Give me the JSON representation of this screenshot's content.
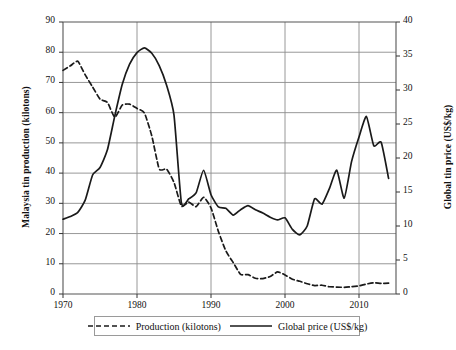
{
  "chart_data": {
    "type": "line",
    "title": "",
    "xlabel": "",
    "xlim": [
      1970,
      2015
    ],
    "xticks": [
      1970,
      1980,
      1990,
      2000,
      2010
    ],
    "grid": true,
    "legend_position": "bottom",
    "axes": [
      {
        "id": "left",
        "label": "Malaysia tin production (kilotons)",
        "ylim": [
          0,
          90
        ],
        "yticks": [
          0,
          10,
          20,
          30,
          40,
          50,
          60,
          70,
          80,
          90
        ]
      },
      {
        "id": "right",
        "label": "Global tin price (US$/kg)",
        "ylim": [
          0,
          40
        ],
        "yticks": [
          0,
          5,
          10,
          15,
          20,
          25,
          30,
          35,
          40
        ]
      }
    ],
    "x": [
      1970,
      1971,
      1972,
      1973,
      1974,
      1975,
      1976,
      1977,
      1978,
      1979,
      1980,
      1981,
      1982,
      1983,
      1984,
      1985,
      1986,
      1987,
      1988,
      1989,
      1990,
      1991,
      1992,
      1993,
      1994,
      1995,
      1996,
      1997,
      1998,
      1999,
      2000,
      2001,
      2002,
      2003,
      2004,
      2005,
      2006,
      2007,
      2008,
      2009,
      2010,
      2011,
      2012,
      2013,
      2014
    ],
    "series": [
      {
        "name": "Production (kilotons)",
        "axis": "left",
        "style": "dashed",
        "color": "#1a1a1a",
        "values": [
          74.0,
          75.5,
          77.0,
          72.5,
          68.5,
          64.5,
          63.4,
          58.5,
          62.5,
          62.8,
          61.4,
          59.9,
          52.3,
          41.4,
          41.3,
          36.9,
          29.1,
          30.4,
          28.9,
          32.0,
          28.5,
          20.7,
          14.3,
          10.4,
          6.5,
          6.4,
          5.2,
          5.1,
          5.8,
          7.3,
          6.3,
          4.9,
          4.2,
          3.4,
          2.8,
          2.9,
          2.4,
          2.3,
          2.2,
          2.4,
          2.7,
          3.3,
          3.7,
          3.5,
          3.6
        ]
      },
      {
        "name": "Global price (US$/kg)",
        "axis": "right",
        "style": "solid",
        "color": "#1a1a1a",
        "values": [
          11.0,
          11.4,
          12.0,
          13.8,
          17.5,
          18.6,
          21.2,
          26.2,
          30.8,
          33.8,
          35.5,
          36.2,
          35.4,
          33.6,
          30.7,
          26.3,
          13.4,
          14.0,
          14.9,
          18.2,
          14.6,
          12.8,
          12.6,
          11.6,
          12.4,
          13.0,
          12.4,
          11.9,
          11.3,
          10.9,
          11.2,
          9.5,
          8.7,
          10.0,
          14.0,
          13.2,
          15.5,
          18.2,
          14.1,
          19.5,
          23.1,
          26.1,
          21.8,
          22.3,
          17.0
        ]
      }
    ]
  },
  "legend": {
    "items": [
      {
        "label": "Production (kilotons)",
        "style": "dashed"
      },
      {
        "label": "Global price (US$/kg)",
        "style": "solid"
      }
    ]
  }
}
